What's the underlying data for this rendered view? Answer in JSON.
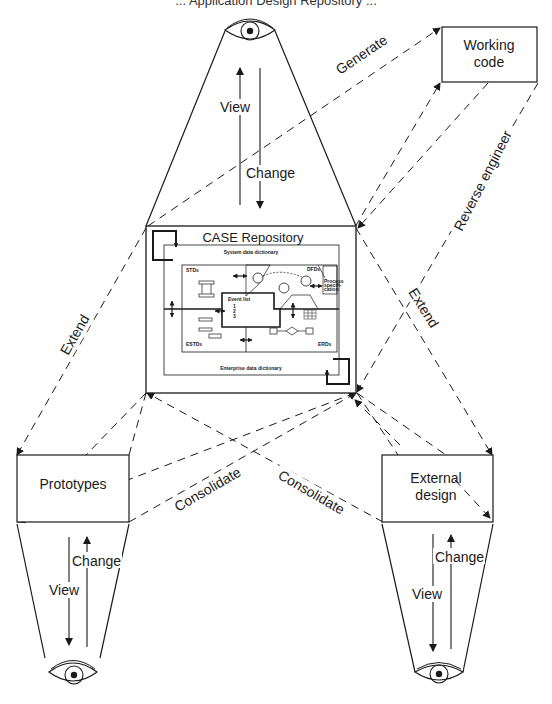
{
  "header": {
    "caption": "... Application Design Repository ..."
  },
  "nodes": {
    "top_view": {
      "view_label": "View",
      "change_label": "Change"
    },
    "working_code": {
      "line1": "Working",
      "line2": "code"
    },
    "repository": {
      "title": "CASE Repository",
      "system_dictionary": "System data dictionary",
      "enterprise_dictionary": "Enterprise data dictionary",
      "stds": "STDs",
      "dfds": "DFDs",
      "process_spec": [
        "Process",
        "specifi-",
        "cation"
      ],
      "event_list": "Event list",
      "event_items": "1\n2\n3",
      "estds": "ESTDs",
      "erds": "ERDs"
    },
    "prototypes": {
      "label": "Prototypes",
      "view_label": "View",
      "change_label": "Change"
    },
    "external_design": {
      "line1": "External",
      "line2": "design",
      "view_label": "View",
      "change_label": "Change"
    }
  },
  "edges": {
    "generate": "Generate",
    "reverse_engineer": "Reverse engineer",
    "extend_left": "Extend",
    "extend_right": "Extend",
    "consolidate_left": "Consolidate",
    "consolidate_right": "Consolidate"
  },
  "colors": {
    "ink": "#1a1a1a",
    "background": "#ffffff"
  }
}
